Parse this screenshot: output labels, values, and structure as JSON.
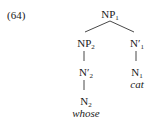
{
  "example_number": "(64)",
  "tree": {
    "root": {
      "label": "NP",
      "sub": "1"
    },
    "left": {
      "label": "NP",
      "sub": "2"
    },
    "right": {
      "label": "N′",
      "sub": "1"
    },
    "left_bar": {
      "label": "N′",
      "sub": "2"
    },
    "right_head": {
      "label": "N",
      "sub": "1"
    },
    "left_head": {
      "label": "N",
      "sub": "2"
    },
    "left_word": "whose",
    "right_word": "cat"
  }
}
